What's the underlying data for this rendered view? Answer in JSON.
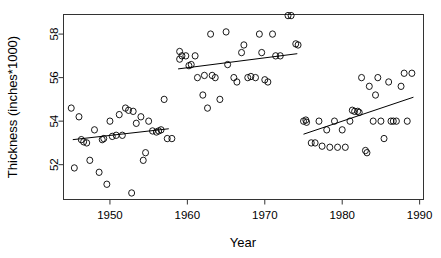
{
  "chart_data": {
    "type": "scatter",
    "title": "",
    "xlabel": "Year",
    "ylabel": "Thickness (inches*1000)",
    "xlim": [
      1944,
      1990.5
    ],
    "ylim": [
      50.4,
      58.9
    ],
    "xticks": [
      1950,
      1960,
      1970,
      1980,
      1990
    ],
    "xtick_labels": [
      "1950",
      "1960",
      "1970",
      "1980",
      "1990"
    ],
    "yticks": [
      52,
      54,
      56,
      58
    ],
    "ytick_labels": [
      "52",
      "54",
      "56",
      "58"
    ],
    "grid": false,
    "legend": null,
    "marker": "open-circle",
    "point_color": "#000000",
    "line_color": "#000000",
    "series": [
      {
        "name": "period-1",
        "x": [
          1945,
          1945.4,
          1946,
          1946.3,
          1946.6,
          1947,
          1947.4,
          1948,
          1948.6,
          1949,
          1949.2,
          1949.6,
          1950,
          1950.3,
          1950.8,
          1951.2,
          1951.6,
          1952,
          1952.4,
          1952.8,
          1953,
          1953.4,
          1954,
          1954.3,
          1954.6,
          1955,
          1955.5,
          1956,
          1956.3,
          1956.6,
          1957,
          1957.4,
          1958
        ],
        "y": [
          54.6,
          51.85,
          54.2,
          53.15,
          53.05,
          53.0,
          52.2,
          53.6,
          51.65,
          53.15,
          53.2,
          51.1,
          54.0,
          53.3,
          53.35,
          54.3,
          53.35,
          54.6,
          54.5,
          50.7,
          54.45,
          53.9,
          54.2,
          52.2,
          52.55,
          54.0,
          53.55,
          53.5,
          53.55,
          53.6,
          55.0,
          53.2,
          53.2
        ]
      },
      {
        "name": "period-2",
        "x": [
          1959,
          1959,
          1959.3,
          1959.8,
          1960.2,
          1960.5,
          1961,
          1961.3,
          1962,
          1962.2,
          1962.6,
          1963,
          1963.2,
          1963.6,
          1964.2,
          1965,
          1965.2,
          1966,
          1966.4,
          1967,
          1967.3,
          1967.8,
          1968.2,
          1968.8,
          1969.3,
          1969.6,
          1970,
          1970.4,
          1971,
          1971.4,
          1972,
          1973,
          1973.4,
          1974,
          1974.3
        ],
        "y": [
          57.2,
          56.85,
          57.0,
          57.0,
          56.55,
          56.6,
          57.0,
          56.0,
          55.2,
          56.1,
          54.6,
          58.0,
          56.1,
          56.0,
          55.0,
          58.1,
          56.6,
          56.0,
          55.8,
          57.15,
          57.5,
          56.0,
          56.05,
          56.0,
          58.0,
          57.15,
          55.9,
          55.8,
          58.0,
          57.0,
          57.0,
          58.85,
          58.85,
          57.55,
          57.5
        ]
      },
      {
        "name": "period-3",
        "x": [
          1975,
          1975.3,
          1975.4,
          1976,
          1976.5,
          1977,
          1977.4,
          1978,
          1978.4,
          1979,
          1979.4,
          1980,
          1980.4,
          1981,
          1981.3,
          1981.6,
          1982,
          1982.2,
          1982.5,
          1983,
          1983.2,
          1983.5,
          1984,
          1984.3,
          1984.6,
          1985,
          1985.4,
          1986,
          1986.3,
          1986.6,
          1987,
          1987.6,
          1988,
          1988.4,
          1989
        ],
        "y": [
          54.0,
          54.05,
          53.95,
          53.0,
          53.0,
          54.0,
          52.85,
          53.6,
          52.8,
          54.0,
          52.8,
          53.6,
          52.8,
          54.0,
          54.5,
          54.45,
          54.45,
          54.4,
          56.0,
          52.65,
          52.55,
          55.6,
          54.0,
          55.2,
          56.0,
          54.0,
          53.2,
          55.8,
          54.0,
          54.0,
          54.0,
          55.6,
          56.2,
          54.0,
          56.2
        ]
      }
    ],
    "trend_lines": [
      {
        "name": "trend-period-1",
        "x": [
          1945.2,
          1957.6
        ],
        "y": [
          53.15,
          53.65
        ]
      },
      {
        "name": "trend-period-2",
        "x": [
          1958.8,
          1974.2
        ],
        "y": [
          56.4,
          57.1
        ]
      },
      {
        "name": "trend-period-3",
        "x": [
          1975.0,
          1989.2
        ],
        "y": [
          53.4,
          55.1
        ]
      }
    ]
  }
}
